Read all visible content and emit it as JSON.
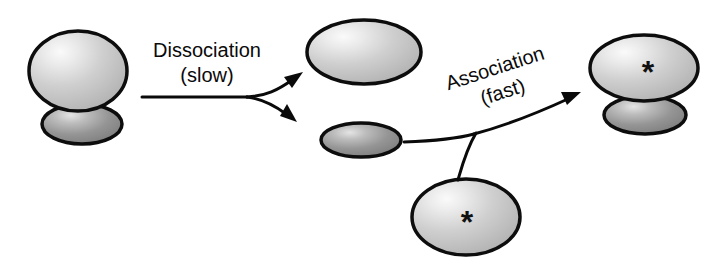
{
  "diagram": {
    "type": "reaction-scheme",
    "background_color": "#ffffff",
    "stroke_color": "#0a0a0a",
    "palette": {
      "large_body_fill": "#c6c6c6",
      "large_body_highlight": "#f2f2f2",
      "small_body_fill": "#8f8f8f",
      "small_body_highlight": "#dcdcdc",
      "outline": "#0d0d0d",
      "text": "#0a0a0a"
    },
    "labels": [
      {
        "id": "dissociation",
        "line1": "Dissociation",
        "line2": "(slow)",
        "rotation_deg": 0,
        "x": 207,
        "y": 57
      },
      {
        "id": "association",
        "line1": "Association",
        "line2": "(fast)",
        "rotation_deg": -18,
        "x": 500,
        "y": 84
      }
    ],
    "shapes": [
      {
        "id": "reactant-complex-large",
        "role": "receptor-body",
        "marker": "",
        "cx": 78,
        "cy": 71,
        "rx": 49,
        "ry": 40,
        "kind": "large"
      },
      {
        "id": "reactant-complex-small",
        "role": "bound-ligand",
        "marker": "",
        "cx": 82,
        "cy": 124,
        "rx": 40,
        "ry": 20,
        "kind": "small"
      },
      {
        "id": "free-receptor",
        "role": "receptor-body",
        "marker": "",
        "cx": 364,
        "cy": 52,
        "rx": 57,
        "ry": 32,
        "kind": "large"
      },
      {
        "id": "free-ligand",
        "role": "free-ligand",
        "marker": "",
        "cx": 361,
        "cy": 140,
        "rx": 40,
        "ry": 17,
        "kind": "small"
      },
      {
        "id": "labeled-free-ligand",
        "role": "labeled-ligand",
        "marker": "*",
        "cx": 466,
        "cy": 217,
        "rx": 54,
        "ry": 38,
        "kind": "large"
      },
      {
        "id": "product-complex-large",
        "role": "receptor-body",
        "marker": "*",
        "cx": 644,
        "cy": 68,
        "rx": 54,
        "ry": 33,
        "kind": "large"
      },
      {
        "id": "product-complex-small",
        "role": "bound-ligand",
        "marker": "",
        "cx": 645,
        "cy": 115,
        "rx": 41,
        "ry": 19,
        "kind": "small"
      }
    ],
    "arrows": [
      {
        "id": "dissociation-arrow",
        "label_ref": "dissociation",
        "description": "single shaft splitting into two arrowheads"
      },
      {
        "id": "association-arrow",
        "label_ref": "association",
        "description": "two shafts merging into one arrowhead"
      }
    ]
  }
}
